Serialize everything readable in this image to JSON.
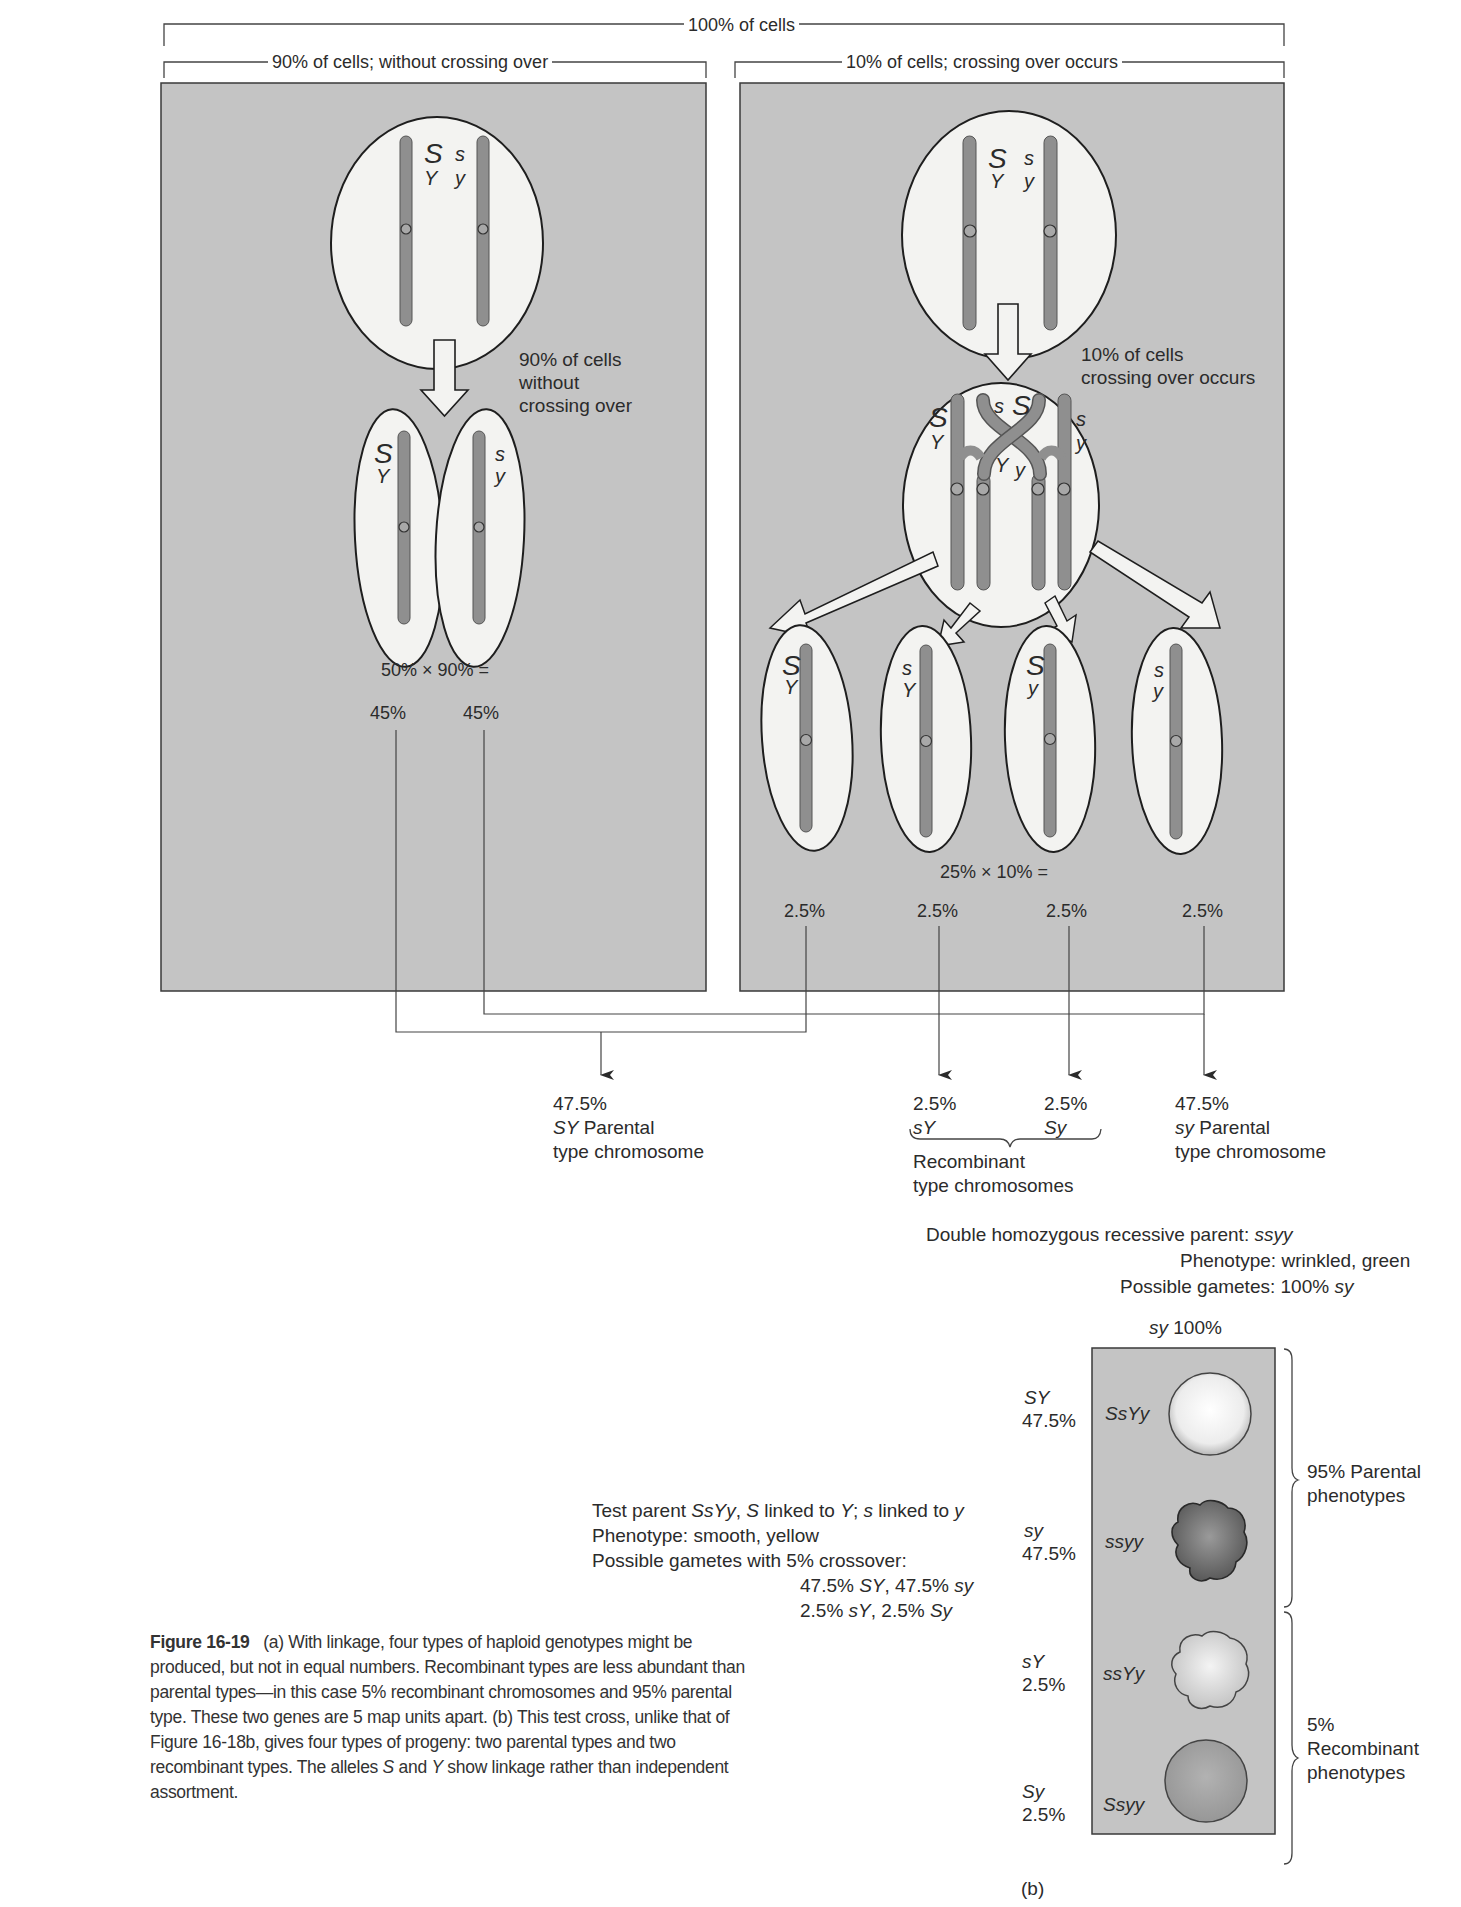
{
  "figure": {
    "number_label": "Figure 16-19",
    "caption_a": "(a) With linkage, four types of haploid genotypes might be produced, but not in equal numbers. Recombinant types are less abundant than parental types—in this case 5% recombinant chromosomes and 95% parental type. These two genes are 5 map units apart.",
    "caption_b_1": "(b) This test cross, unlike that of Figure 16-18b, gives four types of progeny: two parental types and two recombinant types. The alleles ",
    "caption_b_S": "S",
    "caption_b_and": " and ",
    "caption_b_Y": "Y",
    "caption_b_2": " show linkage rather than independent assortment.",
    "part_b_label": "(b)"
  },
  "part_a": {
    "top_bracket": "100% of cells",
    "left_panel": {
      "bracket": "90% of cells; without crossing over",
      "parent_alleles": {
        "S": "S",
        "Y": "Y",
        "s": "s",
        "y": "y"
      },
      "arrow_note": [
        "90% of cells",
        "without",
        "crossing over"
      ],
      "daughters": [
        {
          "top": "S",
          "bottom": "Y"
        },
        {
          "top": "s",
          "bottom": "y"
        }
      ],
      "formula": "50% × 90% =",
      "results": [
        "45%",
        "45%"
      ]
    },
    "right_panel": {
      "bracket": "10% of cells; crossing over occurs",
      "parent_alleles": {
        "S": "S",
        "Y": "Y",
        "s": "s",
        "y": "y"
      },
      "arrow_note": [
        "10% of cells",
        "crossing over occurs"
      ],
      "crossover_alleles": {
        "S_left": "S",
        "Y_left": "Y",
        "s_mid": "s",
        "S_mid": "S",
        "Y_mid": "Y",
        "y_mid": "y",
        "s_right": "s",
        "y_right": "y"
      },
      "daughters": [
        {
          "top": "S",
          "bottom": "Y"
        },
        {
          "top": "s",
          "bottom": "Y"
        },
        {
          "top": "S",
          "bottom": "y"
        },
        {
          "top": "s",
          "bottom": "y"
        }
      ],
      "formula": "25% × 10% =",
      "results": [
        "2.5%",
        "2.5%",
        "2.5%",
        "2.5%"
      ]
    },
    "outcomes": {
      "sy_left": {
        "pct": "47.5%",
        "geno": "SY",
        "line1": " Parental",
        "line2": "type chromosome"
      },
      "recomb": {
        "pct1": "2.5%",
        "geno1": "sY",
        "pct2": "2.5%",
        "geno2": "Sy",
        "line1": "Recombinant",
        "line2": "type chromosomes"
      },
      "sy_right": {
        "pct": "47.5%",
        "geno": "sy",
        "line1": " Parental",
        "line2": "type chromosome"
      }
    }
  },
  "part_b": {
    "recessive_parent": {
      "line1_text": "Double homozygous recessive parent: ",
      "line1_geno": "ssyy",
      "line2": "Phenotype: wrinkled, green",
      "line3_text": "Possible gametes: 100% ",
      "line3_geno": "sy",
      "column_geno": "sy",
      "column_pct": " 100%"
    },
    "test_parent": {
      "l1_a": "Test parent ",
      "l1_geno": "SsYy",
      "l1_b": ", ",
      "l1_S": "S",
      "l1_c": " linked to ",
      "l1_Y": "Y",
      "l1_d": "; ",
      "l1_s": "s",
      "l1_e": " linked to ",
      "l1_y": "y",
      "l2": "Phenotype: smooth, yellow",
      "l3": "Possible gametes with 5% crossover:",
      "l4_a": "47.5% ",
      "l4_g1": "SY",
      "l4_b": ", 47.5% ",
      "l4_g2": "sy",
      "l5_a": "2.5% ",
      "l5_g1": "sY",
      "l5_b": ", 2.5% ",
      "l5_g2": "Sy"
    },
    "progeny": [
      {
        "gamete": "SY",
        "pct": "47.5%",
        "genotype": "SsYy",
        "seed": "smooth-yellow"
      },
      {
        "gamete": "sy",
        "pct": "47.5%",
        "genotype": "ssyy",
        "seed": "wrinkled-green"
      },
      {
        "gamete": "sY",
        "pct": "2.5%",
        "genotype": "ssYy",
        "seed": "wrinkled-yellow"
      },
      {
        "gamete": "Sy",
        "pct": "2.5%",
        "genotype": "Ssyy",
        "seed": "smooth-green"
      }
    ],
    "brackets": {
      "parental": [
        "95% Parental",
        "phenotypes"
      ],
      "recombinant": [
        "5%",
        "Recombinant",
        "phenotypes"
      ]
    }
  },
  "colors": {
    "panel_bg": "#c4c4c4",
    "cell_fill": "#f3f3f1",
    "chromosome": "#8f8f8f",
    "outline": "#1e1e1e",
    "text": "#2b2b2b"
  }
}
